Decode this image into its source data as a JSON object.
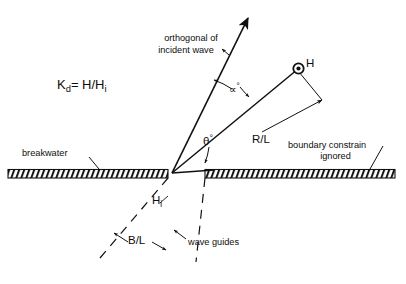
{
  "figure": {
    "type": "diagram",
    "background_color": "#ffffff",
    "ink_color": "#111111"
  },
  "formula": {
    "kd_lead": "K",
    "kd_sub": "d",
    "kd_rest": "= H/H",
    "kd_rest_sub": "i",
    "plain": "Kd = H/Hi"
  },
  "labels": {
    "orthogonal_line1": "orthogonal of",
    "orthogonal_line2": "incident wave",
    "alpha": "∝",
    "alpha_deg": "°",
    "theta": "θ",
    "theta_deg": "°",
    "radius_ratio": "R/L",
    "point_h": "H",
    "incident_height": "H",
    "incident_height_sub": "i",
    "gap_ratio": "B/L",
    "wave_guides": "wave guides",
    "breakwater": "breakwater",
    "boundary_line1": "boundary constrain",
    "boundary_line2": "ignored"
  },
  "elements": {
    "breakwater_left_name": "breakwater-left",
    "breakwater_right_name": "breakwater-right",
    "orthogonal_ray_name": "orthogonal-ray",
    "point_marker_name": "point-h-marker",
    "gap_vertex_name": "gap-vertex"
  }
}
